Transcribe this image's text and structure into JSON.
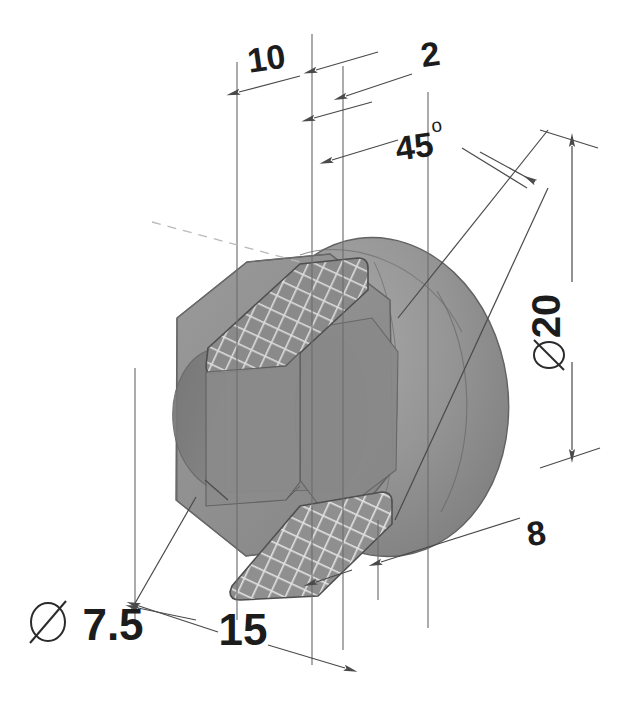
{
  "drawing": {
    "title": "Isometric section view of hex-head plug",
    "type": "engineering-drawing",
    "background_color": "#ffffff",
    "line_color": "#5a5a5a",
    "text_color": "#1c1c1c",
    "body_fill_color": "#8e8e8e",
    "body_fill_light": "#a5a5a5",
    "body_fill_dark": "#7a7a7a",
    "hatch_color": "#d8d8d8",
    "diameter_symbol": "⌀",
    "degree_symbol": "o",
    "dimensions": [
      {
        "id": "dim-10",
        "label": "10",
        "value": 10,
        "unit": "mm",
        "text_x": 268,
        "text_y": 70,
        "font_size": 34,
        "rotation": -8,
        "kind": "linear",
        "position": "top-left"
      },
      {
        "id": "dim-2",
        "label": "2",
        "value": 2,
        "unit": "mm",
        "text_x": 432,
        "text_y": 66,
        "font_size": 34,
        "rotation": -8,
        "kind": "linear",
        "position": "top-right"
      },
      {
        "id": "dim-45-deg",
        "label": "45",
        "value": 45,
        "unit": "deg",
        "suffix": "o",
        "text_x": 416,
        "text_y": 158,
        "font_size": 34,
        "rotation": -8,
        "kind": "angular",
        "position": "upper-right"
      },
      {
        "id": "dim-dia-20",
        "label": "20",
        "value": 20,
        "unit": "mm",
        "prefix": "⌀",
        "text_x": 560,
        "text_y": 322,
        "font_size": 38,
        "rotation": -90,
        "kind": "diameter",
        "position": "right"
      },
      {
        "id": "dim-8",
        "label": "8",
        "value": 8,
        "unit": "mm",
        "text_x": 538,
        "text_y": 545,
        "font_size": 34,
        "rotation": -8,
        "kind": "linear",
        "position": "bottom-right"
      },
      {
        "id": "dim-15",
        "label": "15",
        "value": 15,
        "unit": "mm",
        "text_x": 240,
        "text_y": 643,
        "font_size": 38,
        "rotation": 0,
        "kind": "linear",
        "position": "bottom-center"
      },
      {
        "id": "dim-dia-7-5",
        "label": "7.5",
        "value": 7.5,
        "unit": "mm",
        "prefix": "⌀",
        "text_x": 68,
        "text_y": 638,
        "font_size": 38,
        "rotation": 0,
        "kind": "diameter",
        "position": "bottom-left"
      }
    ]
  }
}
